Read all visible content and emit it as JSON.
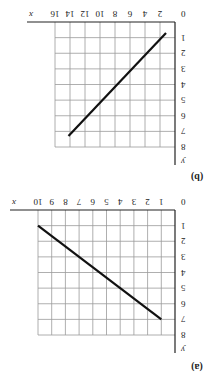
{
  "figure": {
    "rotation_deg": 180,
    "background": "#ffffff",
    "line_color": "#111111",
    "grid_color": "#9a9a9a"
  },
  "chart_data": [
    {
      "type": "line",
      "panel_label": "(a)",
      "title": "",
      "xlabel": "x",
      "ylabel": "y",
      "origin_label": "0",
      "xlim": [
        0,
        10
      ],
      "ylim": [
        0,
        8
      ],
      "xticks": [
        1,
        2,
        3,
        4,
        5,
        6,
        7,
        8,
        9,
        10
      ],
      "yticks": [
        1,
        2,
        3,
        4,
        5,
        6,
        7,
        8
      ],
      "grid": true,
      "series": [
        {
          "name": "line",
          "x": [
            1,
            10
          ],
          "y": [
            7,
            1
          ]
        }
      ]
    },
    {
      "type": "line",
      "panel_label": "(b)",
      "title": "",
      "xlabel": "x",
      "ylabel": "y",
      "origin_label": "0",
      "xlim": [
        0,
        16
      ],
      "ylim": [
        0,
        8
      ],
      "xticks": [
        2,
        4,
        6,
        8,
        10,
        12,
        14,
        16
      ],
      "yticks": [
        1,
        2,
        3,
        4,
        5,
        6,
        7,
        8
      ],
      "grid": true,
      "series": [
        {
          "name": "line",
          "x": [
            1.2,
            14.2
          ],
          "y": [
            0.7,
            7.3
          ]
        }
      ]
    }
  ]
}
